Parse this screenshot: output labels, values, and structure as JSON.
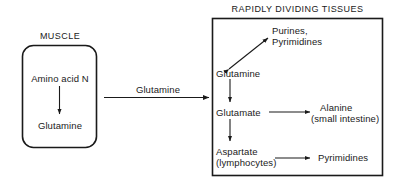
{
  "figure": {
    "type": "biochemical-pathway-diagram",
    "background_color": "#ffffff",
    "line_color": "#1a1a1a",
    "text_color": "#1a1a1a"
  },
  "muscle_panel": {
    "title": "MUSCLE",
    "shape": "rounded-rectangle",
    "nodes": {
      "substrate": "Amino acid N",
      "product": "Glutamine"
    }
  },
  "transport": {
    "label": "Glutamine",
    "direction": "muscle-to-tissues"
  },
  "tissues_panel": {
    "title": "RAPIDLY DIVIDING TISSUES",
    "shape": "rectangle",
    "nodes": {
      "glutamine": "Glutamine",
      "glutamate": "Glutamate",
      "aspartate_line1": "Aspartate",
      "aspartate_line2": "(lymphocytes)",
      "purines_line1": "Purines,",
      "purines_line2": "Pyrimidines",
      "alanine_line1": "Alanine",
      "alanine_line2": "(small intestine)",
      "pyrimidines": "Pyrimidines"
    }
  }
}
